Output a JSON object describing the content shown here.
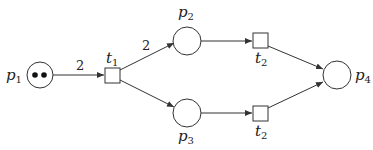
{
  "diagram": {
    "type": "petri-net",
    "places": [
      {
        "id": "p1",
        "name": "p",
        "sub": "1",
        "tokens": 2
      },
      {
        "id": "p2",
        "name": "p",
        "sub": "2",
        "tokens": 0
      },
      {
        "id": "p3",
        "name": "p",
        "sub": "3",
        "tokens": 0
      },
      {
        "id": "p4",
        "name": "p",
        "sub": "4",
        "tokens": 0
      }
    ],
    "transitions": [
      {
        "id": "t1",
        "name": "t",
        "sub": "1"
      },
      {
        "id": "t2a",
        "name": "t",
        "sub": "2"
      },
      {
        "id": "t2b",
        "name": "t",
        "sub": "2"
      }
    ],
    "arcs": [
      {
        "from": "p1",
        "to": "t1",
        "weight": "2"
      },
      {
        "from": "t1",
        "to": "p2",
        "weight": "2"
      },
      {
        "from": "t1",
        "to": "p3",
        "weight": ""
      },
      {
        "from": "p2",
        "to": "t2a",
        "weight": ""
      },
      {
        "from": "p3",
        "to": "t2b",
        "weight": ""
      },
      {
        "from": "t2a",
        "to": "p4",
        "weight": ""
      },
      {
        "from": "t2b",
        "to": "p4",
        "weight": ""
      }
    ],
    "colors": {
      "stroke": "#333333",
      "text": "#222222",
      "background": "#ffffff"
    }
  }
}
